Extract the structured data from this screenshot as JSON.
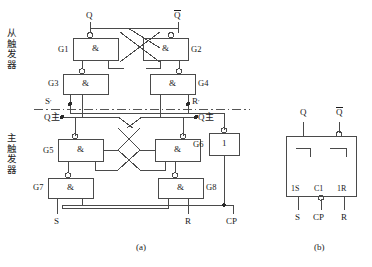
{
  "figure": {
    "title_a": "(a)",
    "title_b": "(b)",
    "group_labels": {
      "slave": "从触发器",
      "master": "主触发器"
    }
  },
  "circuit_a": {
    "outputs": [
      {
        "name": "Q-output",
        "label": "Q",
        "overbar": false,
        "x": 88,
        "y": 14
      },
      {
        "name": "Qbar-output",
        "label": "Q",
        "overbar": true,
        "x": 176,
        "y": 14
      }
    ],
    "gates": [
      {
        "id": "G1",
        "label": "G",
        "sub": "1",
        "symbol": "&",
        "type": "nand",
        "x": 73,
        "y": 38,
        "w": 45,
        "h": 22,
        "label_side": "left"
      },
      {
        "id": "G2",
        "label": "G",
        "sub": "2",
        "symbol": "&",
        "type": "nand",
        "x": 143,
        "y": 38,
        "w": 45,
        "h": 22,
        "label_side": "right"
      },
      {
        "id": "G3",
        "label": "G",
        "sub": "3",
        "symbol": "&",
        "type": "nand",
        "x": 63,
        "y": 74,
        "w": 45,
        "h": 20,
        "label_side": "left"
      },
      {
        "id": "G4",
        "label": "G",
        "sub": "4",
        "symbol": "&",
        "type": "nand",
        "x": 150,
        "y": 74,
        "w": 45,
        "h": 20,
        "label_side": "right"
      },
      {
        "id": "G5",
        "label": "G",
        "sub": "5",
        "symbol": "&",
        "type": "nand",
        "x": 58,
        "y": 139,
        "w": 45,
        "h": 22,
        "label_side": "left"
      },
      {
        "id": "G6",
        "label": "G",
        "sub": "6",
        "symbol": "1",
        "type": "inverter",
        "x": 209,
        "y": 133,
        "w": 30,
        "h": 22,
        "label_side": "left"
      },
      {
        "id": "G7",
        "label": "G",
        "sub": "7",
        "symbol": "&",
        "type": "nand",
        "x": 48,
        "y": 178,
        "w": 45,
        "h": 20,
        "label_side": "left"
      },
      {
        "id": "G8",
        "label": "G",
        "sub": "8",
        "symbol": "&",
        "type": "nand",
        "x": 158,
        "y": 178,
        "w": 45,
        "h": 20,
        "label_side": "right"
      }
    ],
    "nodes": [
      {
        "name": "S-prime-node",
        "label": "S",
        "prime": true,
        "x": 57,
        "y": 102
      },
      {
        "name": "R-prime-node",
        "label": "R",
        "prime": true,
        "x": 185,
        "y": 102
      },
      {
        "name": "Q-master-left",
        "label": "Q",
        "subscript": "主",
        "x": 47,
        "y": 120
      },
      {
        "name": "Q-master-right",
        "label": "Q",
        "subscript": "主",
        "x": 180,
        "y": 120
      }
    ],
    "inputs": [
      {
        "name": "S-input",
        "label": "S",
        "x": 55,
        "y": 222
      },
      {
        "name": "R-input",
        "label": "R",
        "x": 186,
        "y": 222
      },
      {
        "name": "CP-input",
        "label": "CP",
        "x": 230,
        "y": 222
      }
    ],
    "divider": {
      "name": "master-slave-divider",
      "style": "dash-dot"
    }
  },
  "symbol_b": {
    "outputs": [
      {
        "name": "Q-output",
        "label": "Q",
        "overbar": false,
        "bubble": false
      },
      {
        "name": "Qbar-output",
        "label": "Q",
        "overbar": true,
        "bubble": true
      }
    ],
    "pin_labels": [
      {
        "name": "pin-1S",
        "label": "1S"
      },
      {
        "name": "pin-C1",
        "label": "C1",
        "bubble": true
      },
      {
        "name": "pin-1R",
        "label": "1R"
      }
    ],
    "inputs": [
      {
        "name": "S-input",
        "label": "S"
      },
      {
        "name": "CP-input",
        "label": "CP"
      },
      {
        "name": "R-input",
        "label": "R"
      }
    ]
  },
  "colors": {
    "line": "#444444",
    "text": "#1a1a1a",
    "background": "#ffffff",
    "dash": "#555555"
  }
}
